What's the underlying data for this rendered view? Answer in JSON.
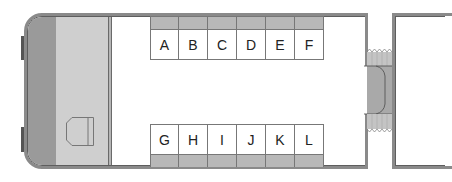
{
  "seat_map": {
    "car": "coach",
    "top_row": {
      "seats": [
        {
          "label": "A"
        },
        {
          "label": "B"
        },
        {
          "label": "C"
        },
        {
          "label": "D"
        },
        {
          "label": "E"
        },
        {
          "label": "F"
        }
      ]
    },
    "bottom_row": {
      "seats": [
        {
          "label": "G"
        },
        {
          "label": "H"
        },
        {
          "label": "I"
        },
        {
          "label": "J"
        },
        {
          "label": "K"
        },
        {
          "label": "L"
        }
      ]
    },
    "icons": {
      "toilet": "toilet-icon",
      "connector": "gangway-connector-icon",
      "door": "door-icon"
    }
  },
  "colors": {
    "wall": "#8a8a8a",
    "cab_dark": "#9a9a9a",
    "cab_light": "#cfcfcf",
    "seat_strip": "#b8b8b8",
    "seat_body": "#ffffff",
    "connector_fill": "#a9a9a9"
  }
}
